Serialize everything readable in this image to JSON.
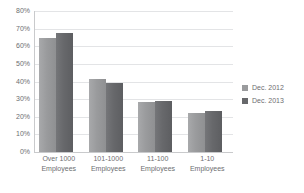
{
  "chart_data": {
    "type": "bar",
    "title": "",
    "xlabel": "",
    "ylabel": "",
    "ylim": [
      0,
      80
    ],
    "ytick_step": 10,
    "grid": true,
    "legend_position": "right",
    "categories": [
      "Over 1000 Employees",
      "101-1000 Employees",
      "11-100 Employees",
      "1-10 Employees"
    ],
    "category_lines": [
      [
        "Over 1000",
        "Employees"
      ],
      [
        "101-1000",
        "Employees"
      ],
      [
        "11-100",
        "Employees"
      ],
      [
        "1-10",
        "Employees"
      ]
    ],
    "ytick_labels": [
      "80%",
      "70%",
      "60%",
      "50%",
      "40%",
      "30%",
      "20%",
      "10%",
      "0%"
    ],
    "ytick_values": [
      80,
      70,
      60,
      50,
      40,
      30,
      20,
      10,
      0
    ],
    "series": [
      {
        "name": "Dec. 2012",
        "color": "#9a9b9d",
        "values": [
          64.8,
          41.3,
          28.1,
          22.1
        ]
      },
      {
        "name": "Dec. 2013",
        "color": "#67686b",
        "values": [
          67.7,
          39.4,
          29.2,
          23.0
        ]
      }
    ]
  },
  "legend": {
    "items": [
      {
        "label": "Dec. 2012",
        "color": "#9a9b9d"
      },
      {
        "label": "Dec. 2013",
        "color": "#67686b"
      }
    ]
  }
}
